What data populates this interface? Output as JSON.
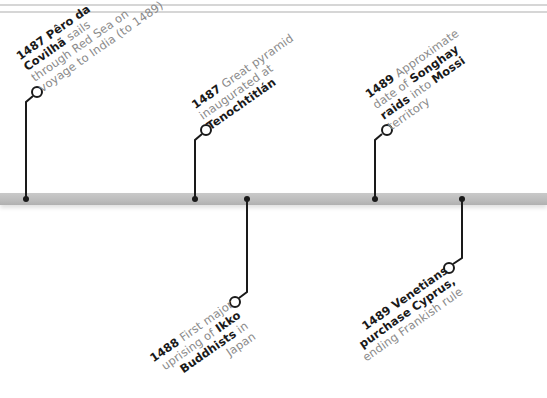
{
  "timeline": {
    "bar_color": "#bdbdbd",
    "line_color": "#1a1a1a",
    "events": [
      {
        "year": "1487",
        "position": "above",
        "lines": [
          {
            "bold": "1487 Pêro da",
            "normal": ""
          },
          {
            "bold": "Covilhã",
            "normal": " sails"
          },
          {
            "bold": "",
            "normal": "through Red Sea on"
          },
          {
            "bold": "",
            "normal": "voyage to India (to 1489)"
          }
        ]
      },
      {
        "year": "1487",
        "position": "above",
        "lines": [
          {
            "bold": "1487",
            "normal": " Great pyramid"
          },
          {
            "bold": "",
            "normal": "inaugurated at"
          },
          {
            "bold": "Tenochtitlán",
            "normal": ""
          }
        ]
      },
      {
        "year": "1488",
        "position": "below",
        "lines": [
          {
            "bold": "1488",
            "normal": " First major"
          },
          {
            "bold": "",
            "normal": "uprising of ",
            "bold2": "Ikko"
          },
          {
            "bold": "Buddhists",
            "normal": " in"
          },
          {
            "bold": "",
            "normal": "Japan"
          }
        ]
      },
      {
        "year": "1489",
        "position": "above",
        "lines": [
          {
            "bold": "1489",
            "normal": " Approximate"
          },
          {
            "bold": "",
            "normal": "date of ",
            "bold2": "Songhay"
          },
          {
            "bold": "raids",
            "normal": " into ",
            "bold2": "Mossi"
          },
          {
            "bold": "",
            "normal": "territory"
          }
        ]
      },
      {
        "year": "1489",
        "position": "below",
        "lines": [
          {
            "bold": "1489 Venetians",
            "normal": ""
          },
          {
            "bold": "purchase Cyprus,",
            "normal": ""
          },
          {
            "bold": "",
            "normal": "ending Frankish rule"
          }
        ]
      }
    ]
  }
}
